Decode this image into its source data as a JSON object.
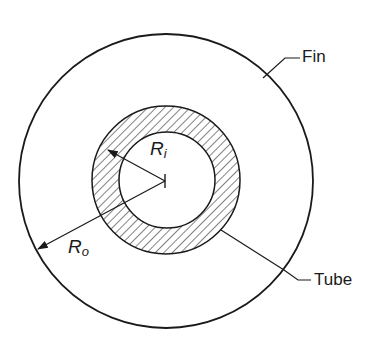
{
  "diagram": {
    "type": "cross-section",
    "labels": {
      "fin": "Fin",
      "tube": "Tube",
      "inner_radius": {
        "symbol": "R",
        "subscript": "i"
      },
      "outer_radius": {
        "symbol": "R",
        "subscript": "o"
      }
    },
    "geometry": {
      "center": [
        165,
        181
      ],
      "fin_outer_radius": 147,
      "tube_outer_radius": 75,
      "tube_inner_radius": 48
    },
    "colors": {
      "stroke": "#1a1a1a",
      "background": "#ffffff"
    }
  }
}
